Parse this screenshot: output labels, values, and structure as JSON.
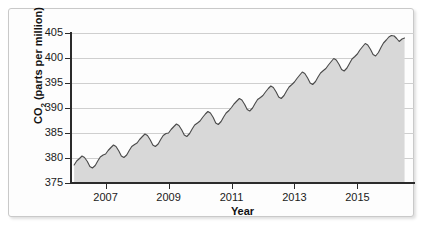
{
  "figure": {
    "axis_title_x": "Year",
    "axis_title_y_main": "CO",
    "axis_title_y_sub": "2",
    "axis_title_y_rest": " (parts per million)"
  },
  "chart_data": {
    "type": "area",
    "title": "",
    "xlabel": "Year",
    "ylabel": "CO2 (parts per million)",
    "xlim": [
      2005.9,
      2016.8
    ],
    "ylim": [
      375,
      405
    ],
    "yticks": [
      375,
      380,
      385,
      390,
      395,
      400,
      405
    ],
    "xticks": [
      2007,
      2009,
      2011,
      2013,
      2015
    ],
    "grid": true,
    "legend": "none",
    "line_color": "#4a4a4a",
    "fill_color": "#d8d8d8",
    "axis_color": "#2b2b2b",
    "gridline_color": "#cfcfcf",
    "series_name": "Atmospheric CO2 concentration",
    "x": [
      2006.0,
      2006.08,
      2006.17,
      2006.25,
      2006.33,
      2006.42,
      2006.5,
      2006.58,
      2006.67,
      2006.75,
      2006.83,
      2006.92,
      2007.0,
      2007.08,
      2007.17,
      2007.25,
      2007.33,
      2007.42,
      2007.5,
      2007.58,
      2007.67,
      2007.75,
      2007.83,
      2007.92,
      2008.0,
      2008.08,
      2008.17,
      2008.25,
      2008.33,
      2008.42,
      2008.5,
      2008.58,
      2008.67,
      2008.75,
      2008.83,
      2008.92,
      2009.0,
      2009.08,
      2009.17,
      2009.25,
      2009.33,
      2009.42,
      2009.5,
      2009.58,
      2009.67,
      2009.75,
      2009.83,
      2009.92,
      2010.0,
      2010.08,
      2010.17,
      2010.25,
      2010.33,
      2010.42,
      2010.5,
      2010.58,
      2010.67,
      2010.75,
      2010.83,
      2010.92,
      2011.0,
      2011.08,
      2011.17,
      2011.25,
      2011.33,
      2011.42,
      2011.5,
      2011.58,
      2011.67,
      2011.75,
      2011.83,
      2011.92,
      2012.0,
      2012.08,
      2012.17,
      2012.25,
      2012.33,
      2012.42,
      2012.5,
      2012.58,
      2012.67,
      2012.75,
      2012.83,
      2012.92,
      2013.0,
      2013.08,
      2013.17,
      2013.25,
      2013.33,
      2013.42,
      2013.5,
      2013.58,
      2013.67,
      2013.75,
      2013.83,
      2013.92,
      2014.0,
      2014.08,
      2014.17,
      2014.25,
      2014.33,
      2014.42,
      2014.5,
      2014.58,
      2014.67,
      2014.75,
      2014.83,
      2014.92,
      2015.0,
      2015.08,
      2015.17,
      2015.25,
      2015.33,
      2015.42,
      2015.5,
      2015.58,
      2015.67,
      2015.75,
      2015.83,
      2015.92,
      2016.0,
      2016.08,
      2016.17,
      2016.25,
      2016.33,
      2016.42,
      2016.5
    ],
    "values": [
      378.6,
      379.4,
      379.9,
      380.4,
      380.1,
      379.3,
      378.3,
      378.0,
      378.5,
      379.4,
      380.2,
      380.6,
      380.8,
      381.5,
      382.1,
      382.6,
      382.3,
      381.4,
      380.4,
      380.1,
      380.6,
      381.5,
      382.3,
      382.7,
      383.0,
      383.7,
      384.3,
      384.8,
      384.5,
      383.6,
      382.6,
      382.3,
      382.8,
      383.7,
      384.5,
      384.9,
      385.0,
      385.7,
      386.3,
      386.8,
      386.5,
      385.6,
      384.6,
      384.3,
      384.9,
      385.8,
      386.6,
      387.0,
      387.4,
      388.1,
      388.8,
      389.3,
      389.0,
      388.1,
      387.0,
      386.7,
      387.3,
      388.2,
      389.0,
      389.5,
      390.1,
      390.8,
      391.4,
      391.9,
      391.6,
      390.7,
      389.7,
      389.4,
      390.0,
      390.9,
      391.7,
      392.1,
      392.5,
      393.2,
      393.9,
      394.4,
      394.1,
      393.2,
      392.2,
      391.9,
      392.5,
      393.4,
      394.2,
      394.7,
      395.2,
      395.9,
      396.6,
      397.2,
      396.9,
      396.0,
      395.0,
      394.7,
      395.3,
      396.2,
      397.0,
      397.5,
      397.9,
      398.6,
      399.3,
      399.9,
      399.6,
      398.7,
      397.7,
      397.4,
      398.0,
      398.9,
      399.8,
      400.3,
      400.8,
      401.6,
      402.3,
      402.9,
      402.6,
      401.7,
      400.7,
      400.4,
      401.1,
      402.1,
      403.0,
      403.6,
      404.2,
      404.5,
      404.4,
      403.9,
      403.3,
      403.8,
      404.0
    ]
  }
}
